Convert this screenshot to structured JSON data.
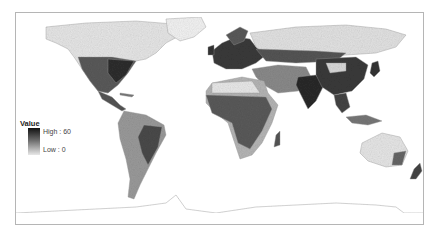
{
  "map": {
    "type": "choropleth-raster",
    "projection": "world equirectangular",
    "color_scheme": {
      "high": "#111111",
      "low": "#f2f2f2",
      "frame_border": "#b5b5b5",
      "background": "#ffffff"
    }
  },
  "legend": {
    "title": "Value",
    "high_label": "High : 60",
    "low_label": "Low : 0",
    "high_value": 60,
    "low_value": 0
  }
}
